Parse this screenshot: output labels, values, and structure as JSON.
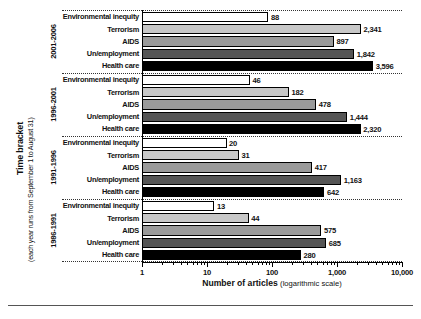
{
  "chart_data": {
    "type": "bar",
    "orientation": "horizontal",
    "title": "",
    "xlabel": "Number of articles (logarithmic scale)",
    "xlabel_bold_part": "Number of articles",
    "xlabel_paren_part": "(logarithmic scale)",
    "ylabel": "Time bracket",
    "ylabel_sub": "(each year runs from September 1 to August 31)",
    "scale": "log",
    "xlim": [
      1,
      10000
    ],
    "xticks": [
      1,
      10,
      100,
      1000,
      10000
    ],
    "xticklabels": [
      "1",
      "10",
      "100",
      "1,000",
      "10,000"
    ],
    "grid": false,
    "legend": "none",
    "categories": [
      "Environmental inequity",
      "Terrorism",
      "AIDS",
      "Un/employment",
      "Health care"
    ],
    "category_colors": [
      "#ffffff",
      "#c8c8c8",
      "#9a9a9a",
      "#555555",
      "#000000"
    ],
    "groups": [
      {
        "bracket": "2001-2006",
        "values": [
          88,
          2341,
          897,
          1842,
          3596
        ],
        "labels": [
          "88",
          "2,341",
          "897",
          "1,842",
          "3,596"
        ]
      },
      {
        "bracket": "1996-2001",
        "values": [
          46,
          182,
          478,
          1444,
          2320
        ],
        "labels": [
          "46",
          "182",
          "478",
          "1,444",
          "2,320"
        ]
      },
      {
        "bracket": "1991-1996",
        "values": [
          20,
          31,
          417,
          1163,
          642
        ],
        "labels": [
          "20",
          "31",
          "417",
          "1,163",
          "642"
        ]
      },
      {
        "bracket": "1986-1991",
        "values": [
          13,
          44,
          575,
          685,
          280
        ],
        "labels": [
          "13",
          "44",
          "575",
          "685",
          "280"
        ]
      }
    ]
  }
}
